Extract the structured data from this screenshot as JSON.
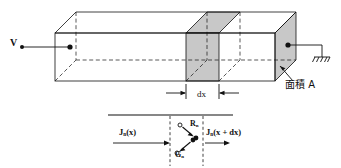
{
  "figure": {
    "colors": {
      "line": "#111111",
      "slab_fill": "#c8c8c8",
      "background": "#ffffff"
    }
  },
  "labels": {
    "voltage": "V",
    "thickness": "dx",
    "area": "面積 A",
    "current_in": "J",
    "current_in_sub": "n",
    "current_in_arg": "(x)",
    "current_out": "J",
    "current_out_sub": "n",
    "current_out_arg": "(x + dx)",
    "recombination": "R",
    "recombination_sub": "n",
    "generation": "G",
    "generation_sub": "n"
  },
  "icons": {
    "ground": "ground-icon",
    "terminal_left": "terminal-dot-icon",
    "terminal_right": "terminal-dot-icon",
    "recombination_pair": "recombination-arrow-icon",
    "generation_pair": "generation-arrow-icon",
    "dx_dimension": "dimension-arrows-icon",
    "area_pointer": "leader-arrow-icon"
  }
}
